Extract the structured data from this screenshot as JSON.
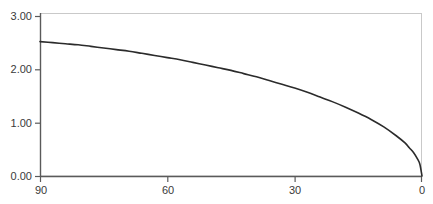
{
  "chart_data": {
    "type": "line",
    "title": "",
    "subtitle": "",
    "xlabel": "",
    "ylabel": "",
    "xlim": [
      90,
      0
    ],
    "ylim": [
      0.0,
      3.0
    ],
    "x_reversed": true,
    "grid": false,
    "legend": null,
    "xticks": [
      90,
      60,
      30,
      0
    ],
    "xtick_labels": [
      "90",
      "60",
      "30",
      "0"
    ],
    "yticks": [
      0.0,
      1.0,
      2.0,
      3.0
    ],
    "ytick_labels": [
      "0.00",
      "1.00",
      "2.00",
      "3.00"
    ],
    "series": [
      {
        "name": "curve",
        "color": "#2b2b2b",
        "x": [
          90,
          87,
          84,
          81,
          78,
          75,
          72,
          69,
          66,
          63,
          60,
          57,
          54,
          51,
          48,
          45,
          42,
          39,
          36,
          33,
          30,
          27,
          24,
          21,
          18,
          15,
          12,
          9,
          6,
          4,
          3,
          2,
          1,
          0.5,
          0
        ],
        "values": [
          2.52,
          2.5,
          2.48,
          2.46,
          2.43,
          2.4,
          2.37,
          2.34,
          2.3,
          2.26,
          2.22,
          2.18,
          2.13,
          2.08,
          2.03,
          1.98,
          1.92,
          1.86,
          1.79,
          1.72,
          1.65,
          1.57,
          1.48,
          1.39,
          1.29,
          1.18,
          1.06,
          0.92,
          0.75,
          0.62,
          0.53,
          0.44,
          0.31,
          0.22,
          0.0
        ]
      }
    ],
    "colors": {
      "line": "#2b2b2b",
      "axis": "#5a5a5a",
      "border": "#c9c9c9",
      "text": "#3a3a3a",
      "background": "#ffffff"
    },
    "geometry": {
      "plot_left": 40,
      "plot_right": 422,
      "plot_top": 16,
      "plot_bottom": 176
    }
  }
}
